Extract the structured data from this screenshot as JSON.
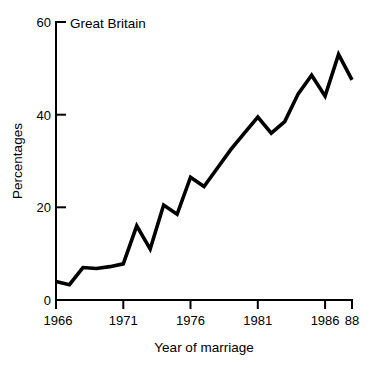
{
  "chart_data": {
    "type": "line",
    "title": "Great Britain",
    "xlabel": "Year of marriage",
    "ylabel": "Percentages",
    "xlim": [
      1966,
      1988
    ],
    "ylim": [
      0,
      60
    ],
    "grid": false,
    "legend": null,
    "x_tick_labels": [
      "1966",
      "1971",
      "1976",
      "1981",
      "1986",
      "88"
    ],
    "x_tick_values": [
      1966,
      1971,
      1976,
      1981,
      1986,
      1988
    ],
    "y_tick_labels": [
      "0",
      "20",
      "40",
      "60"
    ],
    "y_tick_values": [
      0,
      20,
      40,
      60
    ],
    "x": [
      1966,
      1967,
      1968,
      1969,
      1970,
      1971,
      1972,
      1973,
      1974,
      1975,
      1976,
      1977,
      1978,
      1979,
      1980,
      1981,
      1982,
      1983,
      1984,
      1985,
      1986,
      1987,
      1988
    ],
    "values": [
      4.0,
      3.3,
      7.0,
      6.8,
      7.2,
      7.8,
      16.0,
      11.0,
      20.5,
      18.5,
      26.5,
      24.5,
      28.5,
      32.5,
      36.0,
      39.5,
      36.0,
      38.5,
      44.5,
      48.5,
      44.0,
      53.0,
      47.5
    ],
    "series": [
      {
        "name": "Great Britain",
        "color": "#000000",
        "values": [
          4.0,
          3.3,
          7.0,
          6.8,
          7.2,
          7.8,
          16.0,
          11.0,
          20.5,
          18.5,
          26.5,
          24.5,
          28.5,
          32.5,
          36.0,
          39.5,
          36.0,
          38.5,
          44.5,
          48.5,
          44.0,
          53.0,
          47.5
        ]
      }
    ]
  },
  "figure": {
    "background": "#ffffff",
    "line_color": "#000000",
    "axis_color": "#000000"
  }
}
